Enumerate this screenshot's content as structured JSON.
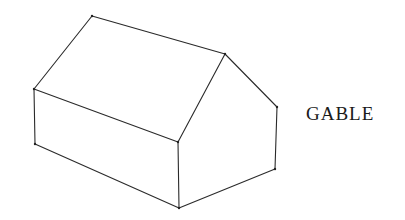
{
  "diagram": {
    "title": "GABLE",
    "colors": {
      "line": "#2a2a2a",
      "background": "#ffffff",
      "text": "#1a1a1a"
    },
    "vertices": {
      "ridge_back": [
        92,
        16
      ],
      "ridge_front": [
        225,
        54
      ],
      "eave_left": [
        34,
        89
      ],
      "eave_front": [
        178,
        142
      ],
      "eave_right": [
        277,
        107
      ],
      "base_left": [
        35,
        144
      ],
      "base_front": [
        179,
        208
      ],
      "base_right": [
        275,
        169
      ]
    },
    "edges": [
      [
        "ridge_back",
        "ridge_front"
      ],
      [
        "ridge_back",
        "eave_left"
      ],
      [
        "eave_left",
        "eave_front"
      ],
      [
        "ridge_front",
        "eave_front"
      ],
      [
        "ridge_front",
        "eave_right"
      ],
      [
        "eave_left",
        "base_left"
      ],
      [
        "eave_front",
        "base_front"
      ],
      [
        "eave_right",
        "base_right"
      ],
      [
        "base_left",
        "base_front"
      ],
      [
        "base_front",
        "base_right"
      ]
    ]
  }
}
